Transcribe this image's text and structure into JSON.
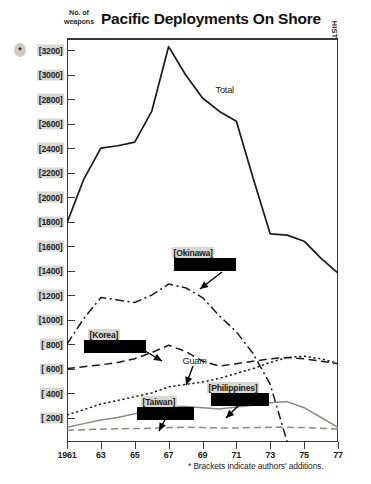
{
  "header": {
    "title": "Pacific Deployments On Shore",
    "y_axis_caption_line1": "No. of",
    "y_axis_caption_line2": "weapons",
    "side_caption": "HISTORY OF THE CUSTODY AND DEPLOYMENT OF NUCLEAR WEAPONS",
    "asterisk": "*"
  },
  "footnote": {
    "text": "* Brackets indicate authors' additions."
  },
  "chart_data": {
    "type": "line",
    "title": "Pacific Deployments On Shore",
    "xlabel": "",
    "ylabel": "No. of weapons",
    "xlim": [
      1961,
      1977
    ],
    "ylim": [
      0,
      3300
    ],
    "ytick_values": [
      3200,
      3000,
      2800,
      2600,
      2400,
      2200,
      2000,
      1800,
      1600,
      1400,
      1200,
      1000,
      800,
      600,
      400,
      200
    ],
    "ytick_labels": [
      "[3200]",
      "[3000]",
      "[2800]",
      "[2600]",
      "[2400]",
      "[2200]",
      "[2000]",
      "[1800]",
      "[1600]",
      "[1400]",
      "[1200]",
      "[1000]",
      "[ 800]",
      "[ 600]",
      "[ 400]",
      "[ 200]"
    ],
    "x": [
      1961,
      1962,
      1963,
      1964,
      1965,
      1966,
      1967,
      1968,
      1969,
      1970,
      1971,
      1972,
      1973,
      1974,
      1975,
      1976,
      1977
    ],
    "xtick_values": [
      1961,
      1963,
      1965,
      1967,
      1969,
      1971,
      1973,
      1975,
      1977
    ],
    "xtick_labels": [
      "1961",
      "63",
      "65",
      "67",
      "69",
      "71",
      "73",
      "75",
      "77"
    ],
    "grid": false,
    "legend": "inline-annotations",
    "series": [
      {
        "name": "Total",
        "label": "Total",
        "bracketed": false,
        "redacted": false,
        "style": "solid",
        "color": "#1a1a1a",
        "values": [
          1790,
          2150,
          2400,
          2420,
          2450,
          2700,
          3230,
          3000,
          2810,
          2700,
          2620,
          2150,
          1700,
          1690,
          1640,
          1500,
          1380
        ]
      },
      {
        "name": "Okinawa",
        "label": "[Okinawa]",
        "bracketed": true,
        "redacted": true,
        "style": "dashdot",
        "color": "#1a1a1a",
        "values": [
          800,
          1010,
          1180,
          1160,
          1140,
          1200,
          1290,
          1260,
          1180,
          1030,
          900,
          720,
          470,
          0,
          0,
          0,
          0
        ]
      },
      {
        "name": "Korea",
        "label": "[Korea]",
        "bracketed": true,
        "redacted": true,
        "style": "dashed",
        "color": "#1a1a1a",
        "values": [
          600,
          615,
          630,
          650,
          680,
          730,
          790,
          740,
          660,
          620,
          640,
          660,
          680,
          690,
          680,
          660,
          640
        ]
      },
      {
        "name": "Guam",
        "label": "Guam",
        "bracketed": false,
        "redacted": false,
        "style": "dotted",
        "color": "#1a1a1a",
        "values": [
          220,
          265,
          310,
          340,
          370,
          400,
          450,
          470,
          490,
          520,
          560,
          600,
          650,
          690,
          700,
          680,
          640
        ]
      },
      {
        "name": "Taiwan",
        "label": "[Taiwan]",
        "bracketed": true,
        "redacted": true,
        "style": "solid-gray",
        "color": "#8a8a85",
        "values": [
          120,
          150,
          180,
          200,
          230,
          260,
          290,
          290,
          280,
          270,
          285,
          300,
          320,
          330,
          280,
          200,
          120
        ]
      },
      {
        "name": "Philippines",
        "label": "[Philippines]",
        "bracketed": true,
        "redacted": true,
        "style": "longdash-gray",
        "color": "#8a8a85",
        "values": [
          95,
          100,
          105,
          108,
          110,
          112,
          118,
          120,
          118,
          115,
          115,
          118,
          120,
          120,
          118,
          112,
          105
        ]
      }
    ],
    "annotations": [
      {
        "text": "Total",
        "bracketed": false,
        "redacted": false
      },
      {
        "text": "[Okinawa]",
        "bracketed": true,
        "redacted": true
      },
      {
        "text": "[Korea]",
        "bracketed": true,
        "redacted": true
      },
      {
        "text": "Guam",
        "bracketed": false,
        "redacted": false
      },
      {
        "text": "[Taiwan]",
        "bracketed": true,
        "redacted": true
      },
      {
        "text": "[Philippines]",
        "bracketed": true,
        "redacted": true
      }
    ]
  }
}
